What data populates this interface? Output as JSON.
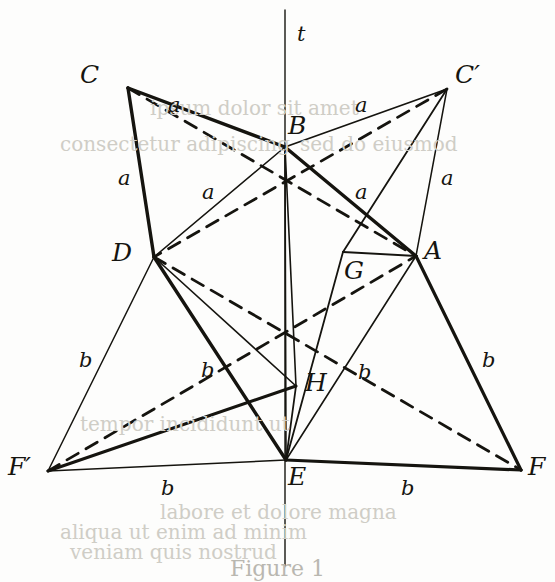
{
  "figure": {
    "type": "geometric-diagram",
    "width": 555,
    "height": 582,
    "background_color": "#fdfdfc",
    "ink_color": "#15140f",
    "axis": {
      "name": "t",
      "label": "t",
      "x": 285,
      "y_top": 10,
      "y_bottom": 566
    },
    "points": [
      {
        "id": "C",
        "label": "C",
        "x": 128,
        "y": 88,
        "label_x": 80,
        "label_y": 62
      },
      {
        "id": "Cp",
        "label": "C′",
        "x": 447,
        "y": 89,
        "label_x": 455,
        "label_y": 62
      },
      {
        "id": "B",
        "label": "B",
        "x": 285,
        "y": 147,
        "label_x": 288,
        "label_y": 113
      },
      {
        "id": "D",
        "label": "D",
        "x": 154,
        "y": 257,
        "label_x": 112,
        "label_y": 240
      },
      {
        "id": "A",
        "label": "A",
        "x": 416,
        "y": 256,
        "label_x": 424,
        "label_y": 238
      },
      {
        "id": "G",
        "label": "G",
        "x": 343,
        "y": 252,
        "label_x": 344,
        "label_y": 258
      },
      {
        "id": "H",
        "label": "H",
        "x": 296,
        "y": 386,
        "label_x": 305,
        "label_y": 370
      },
      {
        "id": "E",
        "label": "E",
        "x": 286,
        "y": 460,
        "label_x": 288,
        "label_y": 464
      },
      {
        "id": "F",
        "label": "F",
        "x": 521,
        "y": 470,
        "label_x": 528,
        "label_y": 454
      },
      {
        "id": "Fp",
        "label": "F′",
        "x": 48,
        "y": 471,
        "label_x": 8,
        "label_y": 454
      }
    ],
    "segment_labels": [
      {
        "text": "a",
        "x": 168,
        "y": 95,
        "for": "C-B"
      },
      {
        "text": "a",
        "x": 355,
        "y": 95,
        "for": "B-C-prime"
      },
      {
        "text": "a",
        "x": 118,
        "y": 168,
        "for": "C-D"
      },
      {
        "text": "a",
        "x": 202,
        "y": 182,
        "for": "D-B"
      },
      {
        "text": "a",
        "x": 355,
        "y": 182,
        "for": "B-A"
      },
      {
        "text": "a",
        "x": 441,
        "y": 168,
        "for": "A-C-prime"
      },
      {
        "text": "b",
        "x": 79,
        "y": 350,
        "for": "D-F-prime"
      },
      {
        "text": "b",
        "x": 201,
        "y": 360,
        "for": "D-E"
      },
      {
        "text": "b",
        "x": 358,
        "y": 362,
        "for": "E-A"
      },
      {
        "text": "b",
        "x": 482,
        "y": 350,
        "for": "A-F"
      },
      {
        "text": "b",
        "x": 161,
        "y": 478,
        "for": "F-prime-E"
      },
      {
        "text": "b",
        "x": 401,
        "y": 478,
        "for": "E-F"
      }
    ],
    "edges": [
      {
        "id": "axis-t",
        "from": "axis-top",
        "to": "axis-bottom",
        "style": "thin",
        "stroke_width": 1.4
      },
      {
        "id": "C-B",
        "from": "C",
        "to": "B",
        "style": "bold",
        "stroke_width": 3.4
      },
      {
        "id": "C-D",
        "from": "C",
        "to": "D",
        "style": "bold",
        "stroke_width": 3.4
      },
      {
        "id": "C-A",
        "from": "C",
        "to": "A",
        "style": "dashed",
        "stroke_width": 2.8
      },
      {
        "id": "D-B",
        "from": "D",
        "to": "B",
        "style": "thin",
        "stroke_width": 1.5
      },
      {
        "id": "B-Cp",
        "from": "B",
        "to": "Cp",
        "style": "thin",
        "stroke_width": 1.8
      },
      {
        "id": "B-A",
        "from": "B",
        "to": "A",
        "style": "bold",
        "stroke_width": 3.4
      },
      {
        "id": "A-Cp",
        "from": "A",
        "to": "Cp",
        "style": "thin",
        "stroke_width": 1.5
      },
      {
        "id": "Cp-D",
        "from": "Cp",
        "to": "D",
        "style": "dashed",
        "stroke_width": 2.8
      },
      {
        "id": "Cp-G",
        "from": "Cp",
        "to": "G",
        "style": "thin",
        "stroke_width": 1.8
      },
      {
        "id": "D-E",
        "from": "D",
        "to": "E",
        "style": "bold",
        "stroke_width": 3.4
      },
      {
        "id": "D-Fp",
        "from": "D",
        "to": "Fp",
        "style": "thin",
        "stroke_width": 1.5
      },
      {
        "id": "D-H",
        "from": "D",
        "to": "H",
        "style": "thin",
        "stroke_width": 1.6
      },
      {
        "id": "Fp-E",
        "from": "Fp",
        "to": "E",
        "style": "thin",
        "stroke_width": 1.5
      },
      {
        "id": "Fp-H",
        "from": "Fp",
        "to": "H",
        "style": "bold",
        "stroke_width": 3.0
      },
      {
        "id": "Fp-A",
        "from": "Fp",
        "to": "A",
        "style": "dashed",
        "stroke_width": 2.8
      },
      {
        "id": "E-A",
        "from": "E",
        "to": "A",
        "style": "thin",
        "stroke_width": 1.6
      },
      {
        "id": "E-F",
        "from": "E",
        "to": "F",
        "style": "bold",
        "stroke_width": 3.2
      },
      {
        "id": "A-F",
        "from": "A",
        "to": "F",
        "style": "bold",
        "stroke_width": 3.2
      },
      {
        "id": "E-G",
        "from": "E",
        "to": "G",
        "style": "thin",
        "stroke_width": 1.8
      },
      {
        "id": "G-A",
        "from": "G",
        "to": "A",
        "style": "thin",
        "stroke_width": 1.8
      },
      {
        "id": "E-H",
        "from": "E",
        "to": "H",
        "style": "thin",
        "stroke_width": 1.8
      },
      {
        "id": "E-B",
        "from": "E",
        "to": "B",
        "style": "thin",
        "stroke_width": 1.6
      },
      {
        "id": "D-F",
        "from": "D",
        "to": "F",
        "style": "dashed",
        "stroke_width": 2.8
      },
      {
        "id": "B-H",
        "from": "B",
        "to": "H",
        "style": "thin",
        "stroke_width": 1.6
      }
    ],
    "caption": "Figure 1"
  },
  "ghost_text": {
    "note": "faint bleed-through text from reverse side of printed page",
    "lines": [
      {
        "text": "ipsum dolor sit amet",
        "x": 150,
        "y": 96
      },
      {
        "text": "consectetur adipiscing",
        "x": 60,
        "y": 132
      },
      {
        "text": "sed do eiusmod",
        "x": 300,
        "y": 132
      },
      {
        "text": "tempor incididunt ut",
        "x": 80,
        "y": 412
      },
      {
        "text": "labore et dolore magna",
        "x": 160,
        "y": 500
      },
      {
        "text": "aliqua ut enim ad minim",
        "x": 60,
        "y": 520
      },
      {
        "text": "veniam quis nostrud",
        "x": 70,
        "y": 540
      }
    ]
  }
}
